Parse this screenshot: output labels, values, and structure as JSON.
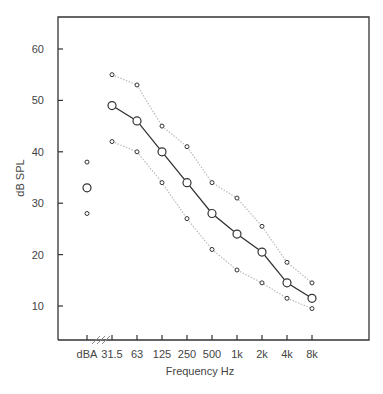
{
  "chart_data": {
    "type": "line",
    "title": "",
    "xlabel": "Frequency Hz",
    "ylabel": "dB SPL",
    "categories": [
      "dBA",
      "31.5",
      "63",
      "125",
      "250",
      "500",
      "1k",
      "2k",
      "4k",
      "8k"
    ],
    "yticks": [
      10,
      20,
      30,
      40,
      50,
      60
    ],
    "ylim": [
      3.5,
      66
    ],
    "grid": false,
    "legend": null,
    "axis_break_after_category": "dBA",
    "series": [
      {
        "name": "median",
        "style": "solid",
        "marker": "large-circle",
        "color": "#333333",
        "values": [
          33,
          49,
          46,
          40,
          34,
          28,
          24,
          20.5,
          14.5,
          11.5
        ]
      },
      {
        "name": "upper",
        "style": "dotted",
        "marker": "small-circle",
        "color": "#bbbbbb",
        "values": [
          38,
          55,
          53,
          45,
          41,
          34,
          31,
          25.5,
          18.5,
          14.5
        ]
      },
      {
        "name": "lower",
        "style": "dotted",
        "marker": "small-circle",
        "color": "#bbbbbb",
        "values": [
          28,
          42,
          40,
          34,
          27,
          21,
          17,
          14.5,
          11.5,
          9.5
        ]
      }
    ],
    "connected_from_category_index": 1
  }
}
